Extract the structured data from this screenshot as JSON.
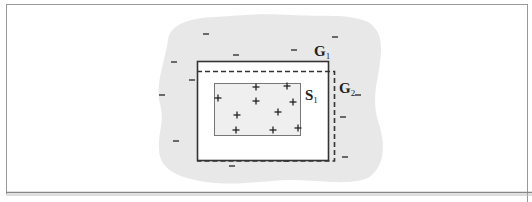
{
  "figure": {
    "colors": {
      "frame": "#8a8a8a",
      "blob": "#e6e6e6",
      "rect": "#333333",
      "inner_fill": "#eeeeee",
      "inner_stroke": "#777777",
      "text": "#222222"
    },
    "labels": {
      "g1": {
        "main": "G",
        "sub": "1"
      },
      "g2": {
        "main": "G",
        "sub": "2"
      },
      "s1": {
        "main": "S",
        "sub": "1"
      }
    },
    "plus_symbol": "+",
    "minus_symbol": "−",
    "plus_points": [
      [
        218,
        98
      ],
      [
        256,
        87
      ],
      [
        287,
        86
      ],
      [
        256,
        101
      ],
      [
        293,
        102
      ],
      [
        237,
        115
      ],
      [
        278,
        112
      ],
      [
        236,
        130
      ],
      [
        273,
        130
      ],
      [
        298,
        128
      ]
    ],
    "minus_points": [
      [
        206,
        34
      ],
      [
        236,
        55
      ],
      [
        294,
        50
      ],
      [
        335,
        37
      ],
      [
        174,
        62
      ],
      [
        162,
        95
      ],
      [
        192,
        80
      ],
      [
        176,
        141
      ],
      [
        232,
        166
      ],
      [
        286,
        161
      ],
      [
        343,
        117
      ],
      [
        358,
        95
      ],
      [
        345,
        157
      ]
    ]
  }
}
